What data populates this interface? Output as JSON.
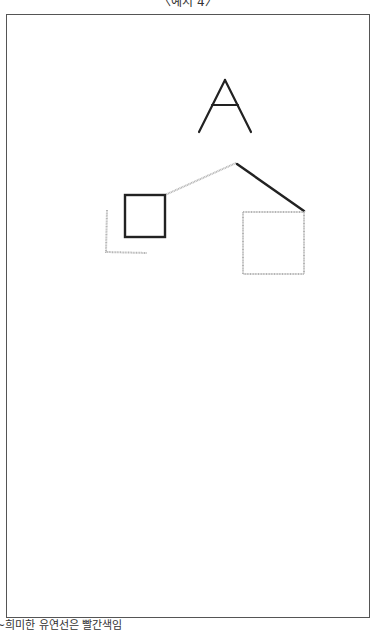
{
  "header": {
    "caption": "〈예시 4〉"
  },
  "footer": {
    "note": "~희미한 유연선은 빨간색임"
  },
  "diagram": {
    "letter": "A",
    "colors": {
      "dark": "#222222",
      "faint": "#b5b5b5",
      "frame": "#555555"
    },
    "elements": [
      {
        "id": "letter-a",
        "kind": "glyph",
        "style": "dark"
      },
      {
        "id": "dark-square",
        "kind": "square",
        "style": "dark"
      },
      {
        "id": "faint-square",
        "kind": "square",
        "style": "faint"
      },
      {
        "id": "faint-corner",
        "kind": "L-shape",
        "style": "faint"
      },
      {
        "id": "faint-diagonal",
        "kind": "line",
        "style": "faint"
      },
      {
        "id": "dark-diagonal",
        "kind": "line",
        "style": "dark"
      }
    ]
  }
}
